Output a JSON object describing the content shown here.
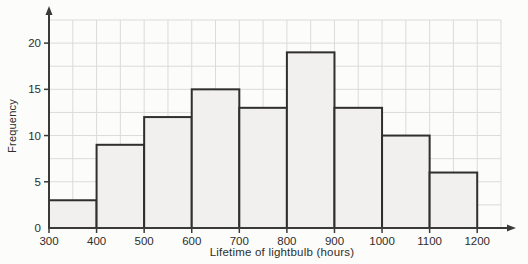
{
  "chart_data": {
    "type": "histogram",
    "title": "",
    "xlabel": "Lifetime of lightbulb (hours)",
    "ylabel": "Frequency",
    "bin_edges": [
      300,
      400,
      500,
      600,
      700,
      800,
      900,
      1000,
      1100,
      1200
    ],
    "values": [
      3,
      9,
      12,
      15,
      13,
      19,
      13,
      10,
      6
    ],
    "xticks": [
      300,
      400,
      500,
      600,
      700,
      800,
      900,
      1000,
      1100,
      1200
    ],
    "yticks": [
      0,
      5,
      10,
      15,
      20
    ],
    "xlim": [
      300,
      1250
    ],
    "ylim": [
      0,
      22.5
    ],
    "grid": {
      "on": true,
      "x_minor_step": 50,
      "y_minor_step": 2.5
    },
    "legend": "none",
    "colors": {
      "bar_fill": "#f1f0ee",
      "bar_border": "#2f2f2f",
      "grid_line": "#dbdbdb",
      "axis_line": "#3a3a3a",
      "text": "#2d2d2d",
      "background": "#fcfcfa"
    }
  }
}
